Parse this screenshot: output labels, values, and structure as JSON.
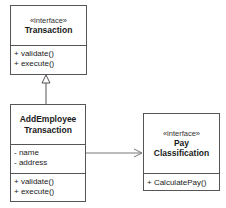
{
  "diagram": {
    "type": "UML class diagram",
    "classes": {
      "transaction": {
        "stereotype": "«interface»",
        "name": "Transaction",
        "attributes": [],
        "operations": [
          "+ validate()",
          "+ execute()"
        ]
      },
      "add_employee": {
        "name_line1": "AddEmployee",
        "name_line2": "Transaction",
        "attributes": [
          "- name",
          "- address"
        ],
        "operations": [
          "+ validate()",
          "+ execute()"
        ]
      },
      "pay_classification": {
        "stereotype": "«interface»",
        "name_line1": "Pay",
        "name_line2": "Classification",
        "operations": [
          "+ CalculatePay()"
        ]
      }
    },
    "relationships": [
      {
        "from": "AddEmployee Transaction",
        "to": "Transaction",
        "type": "realization/generalization"
      },
      {
        "from": "AddEmployee Transaction",
        "to": "Pay Classification",
        "type": "association (navigable)"
      }
    ],
    "colors": {
      "line": "#555555",
      "text": "#1a1a1a",
      "background": "#ffffff"
    }
  }
}
